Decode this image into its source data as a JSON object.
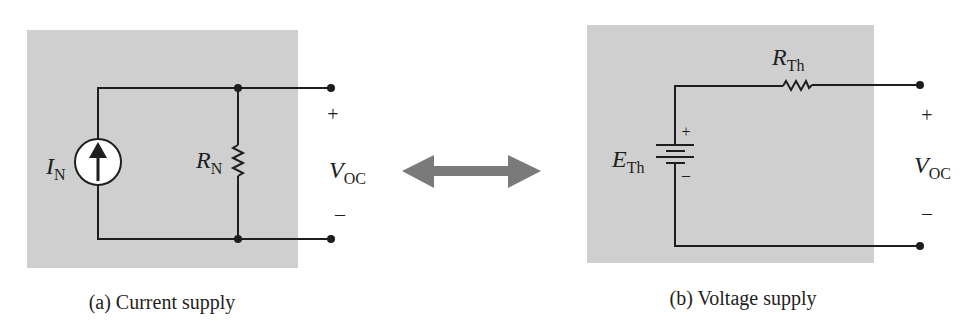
{
  "diagram": {
    "left": {
      "caption": "(a) Current supply",
      "source_label": "I",
      "source_sub": "N",
      "resistor_label": "R",
      "resistor_sub": "N",
      "output_label": "V",
      "output_sub": "OC",
      "plus": "+",
      "minus": "–"
    },
    "right": {
      "caption": "(b) Voltage supply",
      "source_label": "E",
      "source_sub": "Th",
      "resistor_label": "R",
      "resistor_sub": "Th",
      "battery_plus": "+",
      "battery_minus": "–",
      "output_label": "V",
      "output_sub": "OC",
      "plus": "+",
      "minus": "–"
    },
    "equivalence_arrow": "double-arrow-icon",
    "colors": {
      "panel": "#cfcfcf",
      "wire": "#1e1e1e",
      "arrow": "#7a7a7a"
    }
  }
}
